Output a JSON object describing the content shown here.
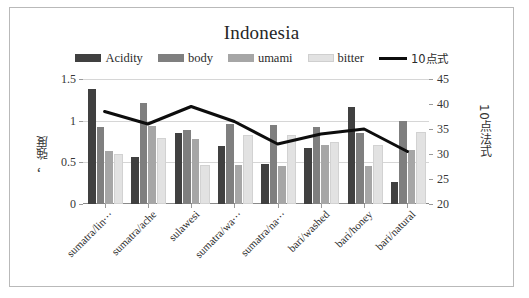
{
  "chart_data": {
    "type": "bar",
    "title": "Indonesia",
    "categories": [
      "sumatra/lin⋯",
      "sumatra/ache",
      "sulawesi",
      "sumatra/wa⋯",
      "sumatra/na⋯",
      "bari/washed",
      "bari/honey",
      "bari/natural"
    ],
    "series": [
      {
        "name": "Acidity",
        "type": "bar",
        "axis": "left",
        "color": "#404040",
        "values": [
          1.38,
          0.57,
          0.85,
          0.7,
          0.48,
          0.67,
          1.17,
          0.26
        ]
      },
      {
        "name": "body",
        "type": "bar",
        "axis": "left",
        "color": "#7f7f7f",
        "values": [
          0.93,
          1.21,
          0.89,
          0.96,
          0.95,
          0.93,
          0.85,
          1.0
        ]
      },
      {
        "name": "umami",
        "type": "bar",
        "axis": "left",
        "color": "#a6a6a6",
        "values": [
          0.64,
          0.94,
          0.78,
          0.47,
          0.46,
          0.71,
          0.46,
          0.65
        ]
      },
      {
        "name": "bitter",
        "type": "bar",
        "axis": "left",
        "color": "#e2e2e2",
        "values": [
          0.58,
          0.77,
          0.44,
          0.81,
          0.8,
          0.72,
          0.69,
          0.84
        ]
      },
      {
        "name": "10点式",
        "type": "line",
        "axis": "right",
        "color": "#0d0d0d",
        "values": [
          38.5,
          36.0,
          39.5,
          36.5,
          32.0,
          34.0,
          35.0,
          30.5
        ]
      }
    ],
    "xlabel": "",
    "ylabel": "，強度",
    "ylabel_secondary": "10点法式",
    "ylim": [
      0,
      1.5
    ],
    "yticks": [
      "0",
      "0.5",
      "1",
      "1.5"
    ],
    "ylim_secondary": [
      20,
      45
    ],
    "yticks_secondary": [
      "20",
      "25",
      "30",
      "35",
      "40",
      "45"
    ],
    "grid": true,
    "legend_position": "top"
  }
}
